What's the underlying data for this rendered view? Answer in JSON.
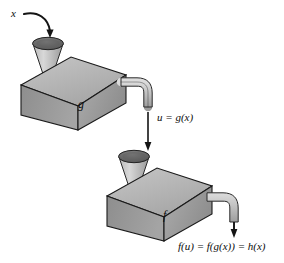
{
  "figure": {
    "type": "function-machine-composition-diagram",
    "title": "",
    "background_color": "#ffffff",
    "width": 284,
    "height": 263
  },
  "labels": {
    "input": "x",
    "intermediate": "u = g(x)",
    "machine_upper": "g",
    "machine_lower": "f",
    "output": "f(u) = f(g(x)) = h(x)"
  },
  "icons": {
    "curved_arrow": "curved-arrow-icon",
    "down_arrow_upper": "down-arrow-icon",
    "down_arrow_lower": "down-arrow-icon",
    "funnel_upper": "funnel-icon",
    "funnel_lower": "funnel-icon",
    "spout_upper": "pipe-spout-icon",
    "spout_lower": "pipe-spout-icon"
  },
  "colors": {
    "box_front": "#9e9e9e",
    "box_top": "#b5b5b5",
    "box_side": "#8a8a8a",
    "funnel_body": "#c9c9c9",
    "funnel_rim": "#6a6a6a",
    "pipe": "#c4c4c4",
    "outline": "#1a1a1a",
    "text": "#0d0d0d"
  },
  "machines": [
    {
      "name": "g",
      "role": "inner-function",
      "input": "x",
      "output": "u = g(x)"
    },
    {
      "name": "f",
      "role": "outer-function",
      "input": "u",
      "output": "f(u) = f(g(x)) = h(x)"
    }
  ]
}
